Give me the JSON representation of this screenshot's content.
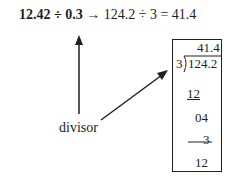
{
  "equation": {
    "dividend_original": "12.42",
    "divide_symbol": "÷",
    "divisor_original": "0.3",
    "arrow": "→",
    "dividend_shifted": "124.2",
    "divisor_shifted": "3",
    "equals": "=",
    "result": "41.4"
  },
  "long_division": {
    "quotient": "41.4",
    "divisor": "3",
    "dividend": "124.2",
    "steps": [
      "12",
      "04",
      "3",
      "12"
    ]
  },
  "annotation": {
    "label": "divisor"
  }
}
